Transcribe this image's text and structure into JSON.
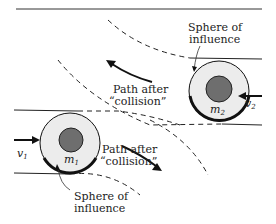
{
  "diagram": {
    "labels": {
      "sphere_top_line1": "Sphere of",
      "sphere_top_line2": "influence",
      "sphere_bottom_line1": "Sphere of",
      "sphere_bottom_line2": "influence",
      "path_top_line1": "Path after",
      "path_top_line2": "“collision”",
      "path_bottom_line1": "Path after",
      "path_bottom_line2": "“collision”",
      "mass1": "m",
      "mass1_sub": "1",
      "mass2": "m",
      "mass2_sub": "2",
      "vel1": "v",
      "vel1_sub": "1",
      "vel2": "v",
      "vel2_sub": "2"
    },
    "colors": {
      "line": "#222222",
      "sphere_fill": "#ececec",
      "core_fill": "#6e6e6e",
      "background": "#ffffff"
    }
  }
}
